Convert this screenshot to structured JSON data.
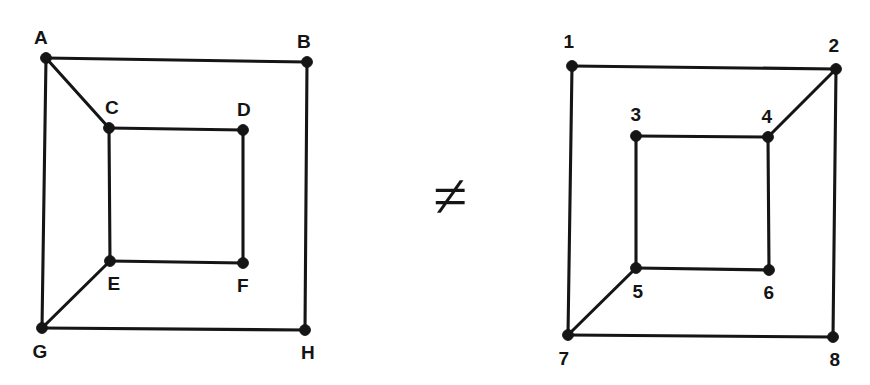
{
  "figure": {
    "background_color": "#ffffff",
    "line_color": "#151515",
    "label_color": "#141414",
    "relation_symbol": "≠",
    "relation_symbol_name": "not-equal-sign",
    "relation_position": {
      "x": 450,
      "y": 196
    },
    "graphs": [
      {
        "id": "left-graph",
        "name": "graph-left-lettered",
        "label_style": "letters",
        "vertices": [
          {
            "id": "A",
            "label": "A",
            "x": 46,
            "y": 58,
            "label_x": 41,
            "label_y": 37
          },
          {
            "id": "B",
            "label": "B",
            "x": 307,
            "y": 62,
            "label_x": 304,
            "label_y": 41
          },
          {
            "id": "C",
            "label": "C",
            "x": 109,
            "y": 128,
            "label_x": 112,
            "label_y": 107
          },
          {
            "id": "D",
            "label": "D",
            "x": 243,
            "y": 130,
            "label_x": 244,
            "label_y": 109
          },
          {
            "id": "E",
            "label": "E",
            "x": 110,
            "y": 261,
            "label_x": 114,
            "label_y": 283
          },
          {
            "id": "F",
            "label": "F",
            "x": 243,
            "y": 263,
            "label_x": 243,
            "label_y": 285
          },
          {
            "id": "G",
            "label": "G",
            "x": 42,
            "y": 328,
            "label_x": 40,
            "label_y": 351
          },
          {
            "id": "H",
            "label": "H",
            "x": 305,
            "y": 330,
            "label_x": 308,
            "label_y": 352
          }
        ],
        "edges": [
          [
            "A",
            "B"
          ],
          [
            "A",
            "G"
          ],
          [
            "A",
            "C"
          ],
          [
            "B",
            "H"
          ],
          [
            "G",
            "H"
          ],
          [
            "C",
            "D"
          ],
          [
            "C",
            "E"
          ],
          [
            "D",
            "F"
          ],
          [
            "E",
            "F"
          ],
          [
            "E",
            "G"
          ]
        ]
      },
      {
        "id": "right-graph",
        "name": "graph-right-numbered",
        "label_style": "numbers",
        "vertices": [
          {
            "id": "1",
            "label": "1",
            "x": 572,
            "y": 66,
            "label_x": 569,
            "label_y": 41
          },
          {
            "id": "2",
            "label": "2",
            "x": 836,
            "y": 69,
            "label_x": 834,
            "label_y": 45
          },
          {
            "id": "3",
            "label": "3",
            "x": 636,
            "y": 136,
            "label_x": 636,
            "label_y": 114
          },
          {
            "id": "4",
            "label": "4",
            "x": 768,
            "y": 137,
            "label_x": 767,
            "label_y": 116
          },
          {
            "id": "5",
            "label": "5",
            "x": 636,
            "y": 268,
            "label_x": 638,
            "label_y": 291
          },
          {
            "id": "6",
            "label": "6",
            "x": 769,
            "y": 270,
            "label_x": 769,
            "label_y": 292
          },
          {
            "id": "7",
            "label": "7",
            "x": 568,
            "y": 335,
            "label_x": 564,
            "label_y": 358
          },
          {
            "id": "8",
            "label": "8",
            "x": 833,
            "y": 337,
            "label_x": 835,
            "label_y": 359
          }
        ],
        "edges": [
          [
            "1",
            "2"
          ],
          [
            "1",
            "7"
          ],
          [
            "2",
            "8"
          ],
          [
            "2",
            "4"
          ],
          [
            "7",
            "8"
          ],
          [
            "3",
            "4"
          ],
          [
            "3",
            "5"
          ],
          [
            "4",
            "6"
          ],
          [
            "5",
            "6"
          ],
          [
            "5",
            "7"
          ]
        ]
      }
    ]
  }
}
